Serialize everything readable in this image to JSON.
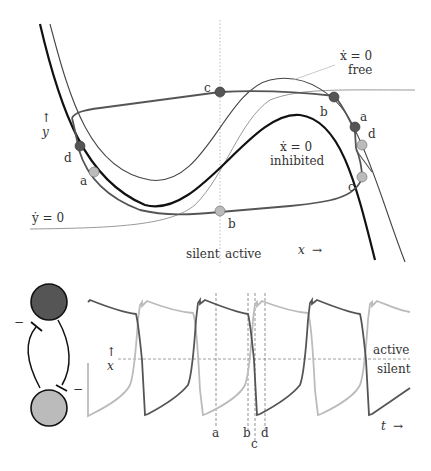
{
  "phase_plane": {
    "y_axis_label": "y",
    "y_axis_arrow": "↑",
    "x_axis_label": "x",
    "x_axis_arrow": "→",
    "nullcline_free_label_line1": "ẋ = 0",
    "nullcline_free_label_line2": "free",
    "nullcline_inhibited_label_line1": "ẋ = 0",
    "nullcline_inhibited_label_line2": "inhibited",
    "nullcline_y_label": "ẏ = 0",
    "region_silent": "silent",
    "region_active": "active",
    "points": [
      {
        "id": "c",
        "label": "c",
        "shade": "dark",
        "neuron": "top"
      },
      {
        "id": "b-dark",
        "label": "b",
        "shade": "dark",
        "neuron": "top"
      },
      {
        "id": "a-dark",
        "label": "a",
        "shade": "dark",
        "neuron": "top"
      },
      {
        "id": "d-light",
        "label": "d",
        "shade": "light",
        "neuron": "bottom"
      },
      {
        "id": "c-light",
        "label": "c",
        "shade": "light",
        "neuron": "bottom"
      },
      {
        "id": "d-dark",
        "label": "d",
        "shade": "dark",
        "neuron": "top"
      },
      {
        "id": "a-light",
        "label": "a",
        "shade": "light",
        "neuron": "bottom"
      },
      {
        "id": "b-light",
        "label": "b",
        "shade": "light",
        "neuron": "bottom"
      }
    ]
  },
  "network": {
    "top_neuron": "dark",
    "bottom_neuron": "light",
    "connection_type": "mutual inhibition",
    "inhibition_mark": "−"
  },
  "timeseries": {
    "y_axis_label": "x",
    "y_axis_arrow": "↑",
    "t_axis_label": "t",
    "t_axis_arrow": "→",
    "threshold_above": "active",
    "threshold_below": "silent",
    "markers": [
      "a",
      "b",
      "c",
      "d"
    ]
  },
  "colors": {
    "dark": "#555555",
    "light": "#bbbbbb",
    "curve": "#111111",
    "thin": "#444444",
    "y_nullcline": "#999999",
    "dashed": "#777777"
  }
}
